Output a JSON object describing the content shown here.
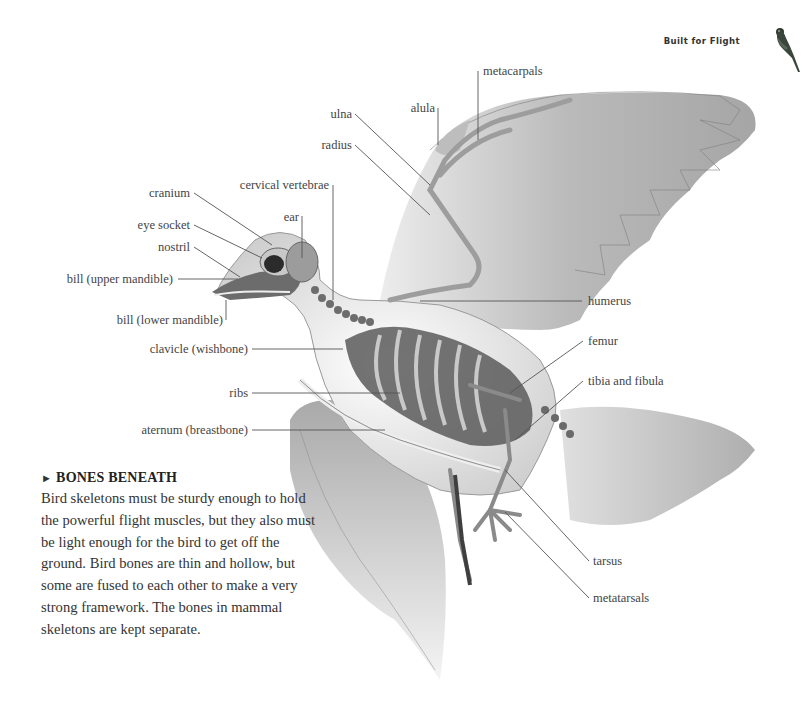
{
  "header": {
    "section_title": "Built for Flight",
    "icon": "parrot-icon"
  },
  "diagram": {
    "labels": {
      "cranium": "cranium",
      "eye_socket": "eye socket",
      "nostril": "nostril",
      "bill_upper": "bill (upper mandible)",
      "bill_lower": "bill (lower mandible)",
      "cervical_vertebrae": "cervical vertebrae",
      "ear": "ear",
      "ulna": "ulna",
      "radius": "radius",
      "alula": "alula",
      "metacarpals": "metacarpals",
      "clavicle": "clavicle (wishbone)",
      "ribs": "ribs",
      "sternum": "aternum (breastbone)",
      "humerus": "humerus",
      "femur": "femur",
      "tibia_fibula": "tibia and fibula",
      "tarsus": "tarsus",
      "metatarsals": "metatarsals"
    }
  },
  "caption": {
    "marker": "►",
    "title": "BONES BENEATH",
    "body": "Bird skeletons must be sturdy enough to hold the powerful flight muscles, but they also must be light enough for the bird to get off the ground. Bird bones are thin and hollow, but some are fused to each other to make a very strong framework. The bones in mammal skeletons are kept separate."
  }
}
